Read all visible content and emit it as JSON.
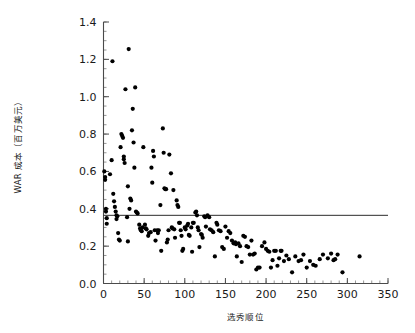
{
  "chart_data": {
    "type": "scatter",
    "title": "",
    "xlabel": "选秀顺位",
    "ylabel": "WAR 成本（百万美元）",
    "xlim": [
      0,
      350
    ],
    "ylim": [
      0.0,
      1.4
    ],
    "grid": false,
    "legend": null,
    "x_ticks": [
      0,
      50,
      100,
      150,
      200,
      250,
      300,
      350
    ],
    "x_tick_labels": [
      "0",
      "50",
      "100",
      "150",
      "200",
      "250",
      "300",
      "350"
    ],
    "x_minor_step": 10,
    "y_ticks": [
      0.0,
      0.2,
      0.4,
      0.6,
      0.8,
      1.0,
      1.2,
      1.4
    ],
    "y_tick_labels": [
      "0.0",
      "0.2",
      "0.4",
      "0.6",
      "0.8",
      "1.0",
      "1.2",
      "1.4"
    ],
    "y_minor_step": 0.05,
    "marker": "circle",
    "marker_color": "#000000",
    "marker_size": 2.1,
    "annotations": [
      {
        "type": "hline",
        "y": 0.365,
        "x_start": 0,
        "x_end": 350,
        "color": "#2b2b2b"
      }
    ],
    "points": [
      [
        1,
        0.6
      ],
      [
        2,
        0.57
      ],
      [
        2,
        0.555
      ],
      [
        3,
        0.4
      ],
      [
        3,
        0.385
      ],
      [
        4,
        0.35
      ],
      [
        4,
        0.32
      ],
      [
        8,
        0.585
      ],
      [
        10,
        0.66
      ],
      [
        11,
        1.19
      ],
      [
        12,
        0.48
      ],
      [
        13,
        0.44
      ],
      [
        14,
        0.41
      ],
      [
        15,
        0.385
      ],
      [
        16,
        0.365
      ],
      [
        16,
        0.345
      ],
      [
        17,
        0.36
      ],
      [
        18,
        0.27
      ],
      [
        19,
        0.235
      ],
      [
        20,
        0.23
      ],
      [
        21,
        0.73
      ],
      [
        22,
        0.8
      ],
      [
        23,
        0.79
      ],
      [
        24,
        0.78
      ],
      [
        25,
        0.68
      ],
      [
        25,
        0.665
      ],
      [
        26,
        0.645
      ],
      [
        27,
        1.04
      ],
      [
        29,
        0.355
      ],
      [
        30,
        0.52
      ],
      [
        30,
        0.225
      ],
      [
        31,
        1.255
      ],
      [
        32,
        0.4
      ],
      [
        33,
        0.455
      ],
      [
        34,
        0.445
      ],
      [
        35,
        0.82
      ],
      [
        36,
        0.935
      ],
      [
        37,
        0.755
      ],
      [
        38,
        0.62
      ],
      [
        39,
        1.05
      ],
      [
        40,
        0.385
      ],
      [
        41,
        0.38
      ],
      [
        42,
        0.375
      ],
      [
        44,
        0.315
      ],
      [
        45,
        0.295
      ],
      [
        46,
        0.285
      ],
      [
        47,
        0.28
      ],
      [
        48,
        0.3
      ],
      [
        49,
        0.73
      ],
      [
        51,
        0.315
      ],
      [
        52,
        0.295
      ],
      [
        53,
        0.29
      ],
      [
        55,
        0.255
      ],
      [
        56,
        0.27
      ],
      [
        58,
        0.275
      ],
      [
        59,
        0.62
      ],
      [
        60,
        0.54
      ],
      [
        61,
        0.71
      ],
      [
        62,
        0.68
      ],
      [
        63,
        0.285
      ],
      [
        64,
        0.23
      ],
      [
        66,
        0.285
      ],
      [
        67,
        0.27
      ],
      [
        68,
        0.285
      ],
      [
        70,
        0.42
      ],
      [
        71,
        0.175
      ],
      [
        73,
        0.83
      ],
      [
        74,
        0.7
      ],
      [
        75,
        0.51
      ],
      [
        76,
        0.505
      ],
      [
        77,
        0.505
      ],
      [
        78,
        0.22
      ],
      [
        79,
        0.235
      ],
      [
        80,
        0.285
      ],
      [
        81,
        0.69
      ],
      [
        83,
        0.59
      ],
      [
        84,
        0.3
      ],
      [
        85,
        0.295
      ],
      [
        86,
        0.5
      ],
      [
        87,
        0.29
      ],
      [
        88,
        0.245
      ],
      [
        90,
        0.445
      ],
      [
        91,
        0.42
      ],
      [
        92,
        0.41
      ],
      [
        93,
        0.325
      ],
      [
        94,
        0.325
      ],
      [
        95,
        0.285
      ],
      [
        96,
        0.255
      ],
      [
        97,
        0.175
      ],
      [
        98,
        0.185
      ],
      [
        100,
        0.3
      ],
      [
        101,
        0.29
      ],
      [
        103,
        0.31
      ],
      [
        104,
        0.32
      ],
      [
        105,
        0.26
      ],
      [
        106,
        0.255
      ],
      [
        108,
        0.3
      ],
      [
        109,
        0.17
      ],
      [
        110,
        0.325
      ],
      [
        111,
        0.325
      ],
      [
        113,
        0.38
      ],
      [
        114,
        0.385
      ],
      [
        115,
        0.365
      ],
      [
        116,
        0.3
      ],
      [
        117,
        0.285
      ],
      [
        118,
        0.195
      ],
      [
        120,
        0.265
      ],
      [
        121,
        0.26
      ],
      [
        122,
        0.245
      ],
      [
        124,
        0.36
      ],
      [
        125,
        0.355
      ],
      [
        126,
        0.305
      ],
      [
        128,
        0.365
      ],
      [
        130,
        0.355
      ],
      [
        131,
        0.29
      ],
      [
        133,
        0.285
      ],
      [
        135,
        0.275
      ],
      [
        137,
        0.145
      ],
      [
        139,
        0.325
      ],
      [
        140,
        0.315
      ],
      [
        142,
        0.285
      ],
      [
        144,
        0.28
      ],
      [
        146,
        0.195
      ],
      [
        148,
        0.185
      ],
      [
        150,
        0.305
      ],
      [
        152,
        0.245
      ],
      [
        154,
        0.28
      ],
      [
        156,
        0.27
      ],
      [
        158,
        0.23
      ],
      [
        160,
        0.215
      ],
      [
        162,
        0.22
      ],
      [
        163,
        0.21
      ],
      [
        164,
        0.145
      ],
      [
        166,
        0.215
      ],
      [
        168,
        0.2
      ],
      [
        170,
        0.115
      ],
      [
        172,
        0.255
      ],
      [
        174,
        0.25
      ],
      [
        176,
        0.2
      ],
      [
        178,
        0.195
      ],
      [
        180,
        0.155
      ],
      [
        182,
        0.23
      ],
      [
        184,
        0.155
      ],
      [
        186,
        0.16
      ],
      [
        188,
        0.075
      ],
      [
        190,
        0.085
      ],
      [
        192,
        0.085
      ],
      [
        195,
        0.2
      ],
      [
        198,
        0.22
      ],
      [
        200,
        0.185
      ],
      [
        202,
        0.175
      ],
      [
        204,
        0.17
      ],
      [
        206,
        0.085
      ],
      [
        208,
        0.125
      ],
      [
        210,
        0.175
      ],
      [
        212,
        0.175
      ],
      [
        214,
        0.095
      ],
      [
        216,
        0.135
      ],
      [
        218,
        0.175
      ],
      [
        219,
        0.175
      ],
      [
        222,
        0.12
      ],
      [
        225,
        0.15
      ],
      [
        228,
        0.13
      ],
      [
        232,
        0.06
      ],
      [
        236,
        0.145
      ],
      [
        240,
        0.12
      ],
      [
        243,
        0.125
      ],
      [
        246,
        0.155
      ],
      [
        250,
        0.085
      ],
      [
        254,
        0.12
      ],
      [
        258,
        0.1
      ],
      [
        261,
        0.095
      ],
      [
        266,
        0.13
      ],
      [
        270,
        0.155
      ],
      [
        276,
        0.135
      ],
      [
        280,
        0.16
      ],
      [
        283,
        0.125
      ],
      [
        285,
        0.13
      ],
      [
        288,
        0.155
      ],
      [
        294,
        0.06
      ],
      [
        315,
        0.145
      ]
    ]
  }
}
